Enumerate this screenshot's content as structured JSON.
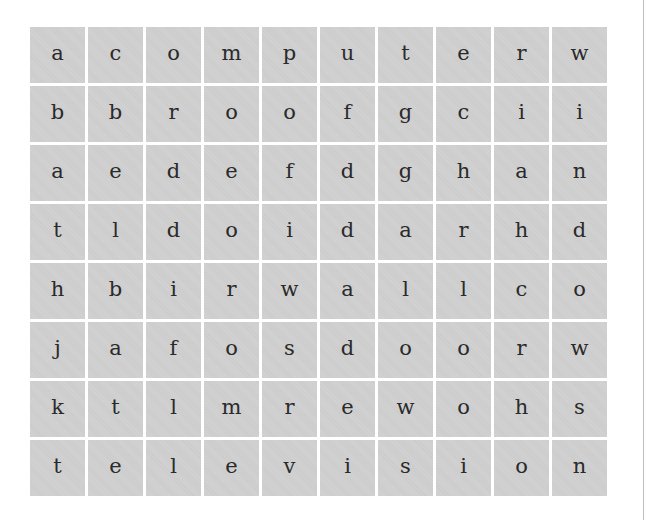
{
  "puzzle": {
    "type": "word-search",
    "rows": 8,
    "columns": 10,
    "cell_color": "#d0d0d0",
    "grid": [
      [
        "a",
        "c",
        "o",
        "m",
        "p",
        "u",
        "t",
        "e",
        "r",
        "w"
      ],
      [
        "b",
        "b",
        "r",
        "o",
        "o",
        "f",
        "g",
        "c",
        "i",
        "i"
      ],
      [
        "a",
        "e",
        "d",
        "e",
        "f",
        "d",
        "g",
        "h",
        "a",
        "n"
      ],
      [
        "t",
        "l",
        "d",
        "o",
        "i",
        "d",
        "a",
        "r",
        "h",
        "d"
      ],
      [
        "h",
        "b",
        "i",
        "r",
        "w",
        "a",
        "l",
        "l",
        "c",
        "o"
      ],
      [
        "j",
        "a",
        "f",
        "o",
        "s",
        "d",
        "o",
        "o",
        "r",
        "w"
      ],
      [
        "k",
        "t",
        "l",
        "m",
        "r",
        "e",
        "w",
        "o",
        "h",
        "s"
      ],
      [
        "t",
        "e",
        "l",
        "e",
        "v",
        "i",
        "s",
        "i",
        "o",
        "n"
      ]
    ]
  }
}
